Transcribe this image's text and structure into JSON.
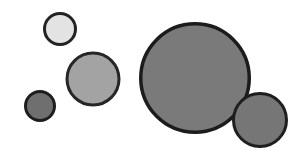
{
  "figure": {
    "title": "",
    "background_color": "#ffffff",
    "width": 298,
    "height": 150
  },
  "chart_data": {
    "type": "scatter",
    "title": "",
    "subtitle": "",
    "xlabel": "",
    "ylabel": "",
    "xlim": [
      0,
      298
    ],
    "ylim": [
      0,
      150
    ],
    "grid": false,
    "legend": null,
    "axes_visible": false,
    "tick_labels": {
      "x": [],
      "y": []
    },
    "annotations": [],
    "marker": {
      "shape": "circle",
      "stroke_color": "#1f1f1f",
      "stroke_width": 3
    },
    "series": [
      {
        "name": "circles",
        "points": [
          {
            "id": "circle-1",
            "label": "small-light-circle",
            "x": 60,
            "y": 29,
            "diameter": 34,
            "radius": 17,
            "fill": "#e3e3e3",
            "stroke": "#232323",
            "stroke_width": 3
          },
          {
            "id": "circle-2",
            "label": "medium-gray-circle",
            "x": 93,
            "y": 79,
            "diameter": 55,
            "radius": 27.5,
            "fill": "#a3a3a3",
            "stroke": "#262626",
            "stroke_width": 3
          },
          {
            "id": "circle-3",
            "label": "small-dark-circle",
            "x": 40,
            "y": 106,
            "diameter": 32,
            "radius": 16,
            "fill": "#6f6f6f",
            "stroke": "#1e1e1e",
            "stroke_width": 3
          },
          {
            "id": "circle-4",
            "label": "large-gray-circle",
            "x": 195,
            "y": 78,
            "diameter": 112,
            "radius": 56,
            "fill": "#7a7a7a",
            "stroke": "#1c1c1c",
            "stroke_width": 3.5
          },
          {
            "id": "circle-5",
            "label": "right-small-circle",
            "x": 260,
            "y": 120,
            "diameter": 56,
            "radius": 28,
            "fill": "#767676",
            "stroke": "#1e1e1e",
            "stroke_width": 3
          }
        ]
      }
    ]
  }
}
